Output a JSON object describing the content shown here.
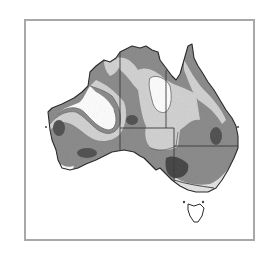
{
  "map": {
    "subject": "Australia",
    "style": "grayscale shaded contour zones",
    "legend": [],
    "zones": [
      {
        "level": "white",
        "color": "#ffffff"
      },
      {
        "level": "light",
        "color": "#d4d4d4"
      },
      {
        "level": "medium",
        "color": "#8e8e8e"
      },
      {
        "level": "dark",
        "color": "#555555"
      }
    ],
    "colors": {
      "frame": "#a8a8a8",
      "coastline": "#2a2a2a",
      "state_borders": "#3a3a3a",
      "contour_lines": "#6a6a6a"
    }
  }
}
